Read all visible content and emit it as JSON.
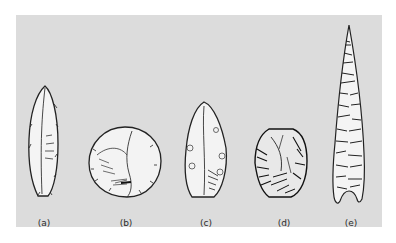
{
  "figure": {
    "background_color": "#dcdcdc",
    "tools": [
      {
        "id": "a",
        "label": "(a)",
        "shape": "narrow-blade"
      },
      {
        "id": "b",
        "label": "(b)",
        "shape": "discoid"
      },
      {
        "id": "c",
        "label": "(c)",
        "shape": "leaf-point"
      },
      {
        "id": "d",
        "label": "(d)",
        "shape": "core"
      },
      {
        "id": "e",
        "label": "(e)",
        "shape": "long-point"
      }
    ]
  }
}
